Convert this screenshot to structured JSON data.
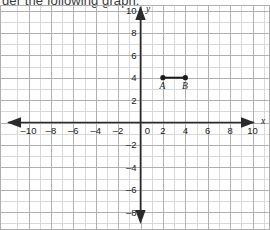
{
  "headline": {
    "text": "der the following graph."
  },
  "chart_data": {
    "type": "scatter",
    "title": "",
    "xlabel": "x",
    "ylabel": "y",
    "grid": true,
    "legend": false,
    "xlim": [
      -10.6,
      10.6
    ],
    "ylim": [
      -9.1,
      10.4
    ],
    "xticks": [
      -10,
      -8,
      -6,
      -4,
      -2,
      0,
      2,
      4,
      6,
      8,
      10
    ],
    "yticks": [
      10,
      8,
      6,
      4,
      2,
      -2,
      -4,
      -6,
      -8
    ],
    "xtick_labels": [
      "-10",
      "-8",
      "-6",
      "-4",
      "-2",
      "0",
      "2",
      "4",
      "6",
      "8",
      "10"
    ],
    "ytick_labels": [
      "10",
      "8",
      "6",
      "4",
      "2",
      "-2",
      "-4",
      "-6",
      "-8"
    ],
    "minor_grid_step": 1,
    "major_grid_step": 2,
    "points": [
      {
        "name": "A",
        "x": 2,
        "y": 4,
        "label": "A"
      },
      {
        "name": "B",
        "x": 4,
        "y": 4,
        "label": "B"
      }
    ],
    "segments": [
      {
        "name": "AB",
        "from": "A",
        "to": "B",
        "x1": 2,
        "y1": 4,
        "x2": 4,
        "y2": 4
      }
    ]
  },
  "colors": {
    "minor_grid": "#d9d9d9",
    "major_grid": "#b0b0b0",
    "axis": "#2b2b2b",
    "point": "#1a1a1a",
    "segment": "#1a1a1a",
    "text": "#1a1a1a",
    "headline_text": "#3a3a3a",
    "background": "#ffffff"
  }
}
